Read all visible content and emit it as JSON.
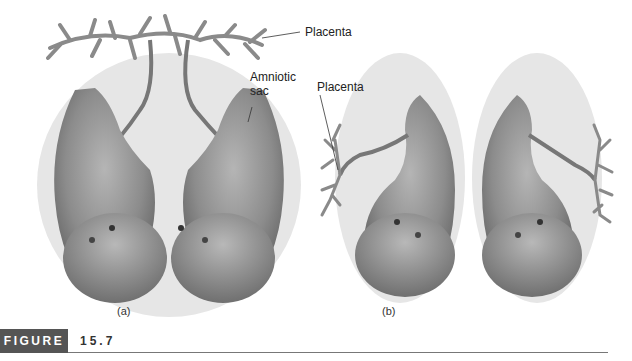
{
  "figure": {
    "label": "FIGURE",
    "number": "15.7"
  },
  "panels": [
    {
      "id": "a",
      "caption": "(a)",
      "labels": {
        "placenta": "Placenta",
        "amniotic_sac_line1": "Amniotic",
        "amniotic_sac_line2": "sac"
      },
      "description": "Twin fetuses sharing one placenta and one amniotic sac"
    },
    {
      "id": "b",
      "caption": "(b)",
      "labels": {
        "placenta": "Placenta"
      },
      "description": "Twin fetuses each with separate placenta and separate amniotic sac"
    }
  ],
  "colors": {
    "sac": "#e6e6e6",
    "fetus_dark": "#6e6e6e",
    "fetus_light": "#c8c8c8",
    "placenta": "#8a8a8a",
    "figure_box": "#555555"
  }
}
